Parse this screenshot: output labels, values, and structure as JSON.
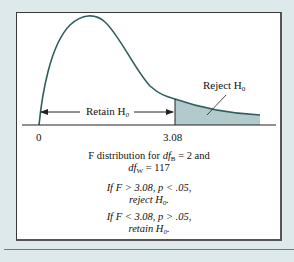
{
  "figure": {
    "retain_label": "Retain H",
    "retain_sub": "0",
    "reject_label": "Reject H",
    "reject_sub": "0",
    "tick_zero": "0",
    "tick_critical": "3.08",
    "caption_line1_pre": "F distribution for ",
    "caption_df": "df",
    "caption_sub_b": "B",
    "caption_line1_post": " = 2 and",
    "caption_sub_w": "W",
    "caption_line2_post": " = 117",
    "rule1_line1": "If F > 3.08, p < .05,",
    "rule1_line2": "reject H",
    "rule1_sub": "0",
    "rule1_end": ".",
    "rule2_line1": "If F < 3.08, p > .05,",
    "rule2_line2": "retain H",
    "rule2_sub": "0",
    "rule2_end": ".",
    "colors": {
      "background": "#dde9ea",
      "curve": "#2f5e5c",
      "shade": "#b3cacd"
    }
  }
}
